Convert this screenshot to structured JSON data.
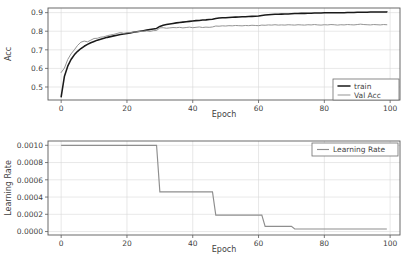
{
  "chart_data": [
    {
      "type": "line",
      "id": "accuracy",
      "title": "",
      "xlabel": "Epoch",
      "ylabel": "Acc",
      "xlim": [
        -4,
        103
      ],
      "ylim": [
        0.43,
        0.925
      ],
      "xticks": [
        0,
        20,
        40,
        60,
        80,
        100
      ],
      "xticklabels": [
        "0",
        "20",
        "40",
        "60",
        "80",
        "100"
      ],
      "yticks": [
        0.5,
        0.6,
        0.7,
        0.8,
        0.9
      ],
      "yticklabels": [
        "0.5",
        "0.6",
        "0.7",
        "0.8",
        "0.9"
      ],
      "grid": true,
      "legend_position": "lower right",
      "x": [
        0,
        1,
        2,
        3,
        4,
        5,
        6,
        7,
        8,
        9,
        10,
        11,
        12,
        13,
        14,
        15,
        16,
        17,
        18,
        19,
        20,
        21,
        22,
        23,
        24,
        25,
        26,
        27,
        28,
        29,
        30,
        31,
        32,
        33,
        34,
        35,
        36,
        37,
        38,
        39,
        40,
        41,
        42,
        43,
        44,
        45,
        46,
        47,
        48,
        49,
        50,
        51,
        52,
        53,
        54,
        55,
        56,
        57,
        58,
        59,
        60,
        61,
        62,
        63,
        64,
        65,
        66,
        67,
        68,
        69,
        70,
        71,
        72,
        73,
        74,
        75,
        76,
        77,
        78,
        79,
        80,
        81,
        82,
        83,
        84,
        85,
        86,
        87,
        88,
        89,
        90,
        91,
        92,
        93,
        94,
        95,
        96,
        97,
        98,
        99
      ],
      "series": [
        {
          "name": "train",
          "color": "#1a1a1a",
          "values": [
            0.447,
            0.558,
            0.612,
            0.648,
            0.673,
            0.692,
            0.707,
            0.719,
            0.729,
            0.738,
            0.745,
            0.752,
            0.757,
            0.762,
            0.767,
            0.771,
            0.775,
            0.779,
            0.782,
            0.785,
            0.788,
            0.791,
            0.794,
            0.797,
            0.8,
            0.803,
            0.806,
            0.809,
            0.812,
            0.815,
            0.826,
            0.832,
            0.836,
            0.839,
            0.842,
            0.845,
            0.847,
            0.849,
            0.851,
            0.853,
            0.855,
            0.857,
            0.858,
            0.86,
            0.861,
            0.863,
            0.864,
            0.869,
            0.871,
            0.872,
            0.873,
            0.874,
            0.875,
            0.876,
            0.877,
            0.878,
            0.878,
            0.879,
            0.88,
            0.881,
            0.882,
            0.885,
            0.887,
            0.889,
            0.89,
            0.891,
            0.891,
            0.892,
            0.893,
            0.893,
            0.894,
            0.895,
            0.895,
            0.896,
            0.896,
            0.897,
            0.897,
            0.898,
            0.898,
            0.898,
            0.899,
            0.899,
            0.899,
            0.9,
            0.9,
            0.9,
            0.9,
            0.901,
            0.901,
            0.901,
            0.902,
            0.902,
            0.902,
            0.902,
            0.903,
            0.903,
            0.903,
            0.903,
            0.903,
            0.904
          ]
        },
        {
          "name": "Val Acc",
          "color": "#8e8e8e",
          "values": [
            0.578,
            0.602,
            0.648,
            0.678,
            0.7,
            0.724,
            0.741,
            0.747,
            0.743,
            0.752,
            0.761,
            0.762,
            0.768,
            0.77,
            0.776,
            0.78,
            0.783,
            0.788,
            0.793,
            0.789,
            0.792,
            0.793,
            0.795,
            0.797,
            0.799,
            0.8,
            0.802,
            0.799,
            0.803,
            0.804,
            0.818,
            0.819,
            0.816,
            0.818,
            0.82,
            0.819,
            0.821,
            0.818,
            0.82,
            0.822,
            0.819,
            0.821,
            0.823,
            0.82,
            0.822,
            0.821,
            0.823,
            0.828,
            0.827,
            0.829,
            0.828,
            0.83,
            0.829,
            0.831,
            0.83,
            0.829,
            0.831,
            0.83,
            0.832,
            0.831,
            0.83,
            0.833,
            0.832,
            0.834,
            0.833,
            0.835,
            0.833,
            0.834,
            0.833,
            0.835,
            0.834,
            0.833,
            0.835,
            0.834,
            0.833,
            0.835,
            0.834,
            0.836,
            0.834,
            0.833,
            0.835,
            0.834,
            0.836,
            0.835,
            0.833,
            0.835,
            0.834,
            0.836,
            0.835,
            0.834,
            0.836,
            0.838,
            0.836,
            0.835,
            0.834,
            0.836,
            0.835,
            0.834,
            0.836,
            0.835
          ]
        }
      ]
    },
    {
      "type": "line",
      "id": "learning-rate",
      "title": "",
      "xlabel": "Epoch",
      "ylabel": "Learning Rate",
      "xlim": [
        -4,
        103
      ],
      "ylim": [
        -4e-05,
        0.00105
      ],
      "xticks": [
        0,
        20,
        40,
        60,
        80,
        100
      ],
      "xticklabels": [
        "0",
        "20",
        "40",
        "60",
        "80",
        "100"
      ],
      "yticks": [
        0.0,
        0.0002,
        0.0004,
        0.0006,
        0.0008,
        0.001
      ],
      "yticklabels": [
        "0.0000",
        "0.0002",
        "0.0004",
        "0.0006",
        "0.0008",
        "0.0010"
      ],
      "grid": true,
      "legend_position": "upper right",
      "x": [
        0,
        29,
        30,
        46,
        47,
        61,
        62,
        70,
        71,
        99
      ],
      "series": [
        {
          "name": "Learning Rate",
          "color": "#8e8e8e",
          "values": [
            0.001,
            0.001,
            0.00046,
            0.00046,
            0.00019,
            0.00019,
            6e-05,
            6e-05,
            3e-05,
            3e-05
          ]
        }
      ]
    }
  ],
  "acc_legend": {
    "entries": [
      {
        "label": "train"
      },
      {
        "label": "Val Acc"
      }
    ]
  },
  "lr_legend": {
    "entries": [
      {
        "label": "Learning Rate"
      }
    ]
  }
}
